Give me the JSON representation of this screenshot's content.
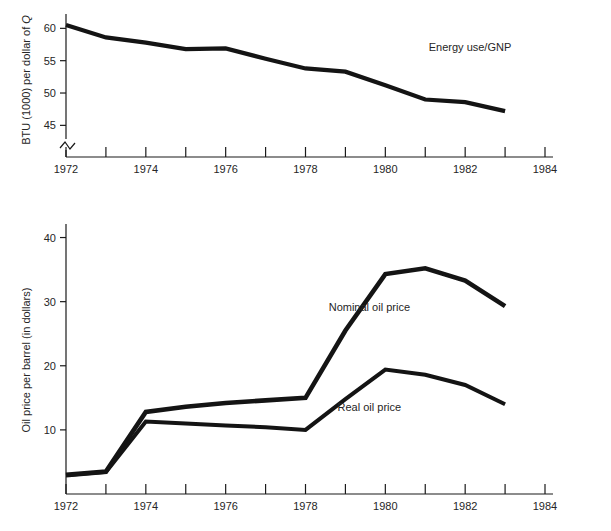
{
  "chart_data": [
    {
      "type": "line",
      "id": "energy-use-gnp",
      "title": "",
      "xlabel": "",
      "ylabel": "BTU (1000) per dollar of Q",
      "ylabel_parts": [
        "BTU (1000) per dollar of ",
        "Q"
      ],
      "annotation": "Energy use/GNP",
      "x": [
        1972,
        1973,
        1974,
        1975,
        1976,
        1977,
        1978,
        1979,
        1980,
        1981,
        1982,
        1983
      ],
      "series": [
        {
          "name": "Energy use/GNP",
          "values": [
            60.5,
            58.6,
            57.8,
            56.8,
            56.9,
            55.3,
            53.8,
            53.3,
            51.2,
            49.0,
            48.6,
            47.2
          ],
          "color": "#141414",
          "width": 4.2
        }
      ],
      "xlim": [
        1972,
        1984
      ],
      "ylim": [
        43.2,
        61.6
      ],
      "xticks": [
        1972,
        1973,
        1974,
        1975,
        1976,
        1977,
        1978,
        1979,
        1980,
        1981,
        1982,
        1983,
        1984
      ],
      "xticklabels": [
        "1972",
        "",
        "1974",
        "",
        "1976",
        "",
        "1978",
        "",
        "1980",
        "",
        "1982",
        "",
        "1984"
      ],
      "yticks": [
        45,
        50,
        55,
        60
      ],
      "yticklabels": [
        "45",
        "50",
        "55",
        "60"
      ],
      "axis_break": true,
      "grid": false,
      "legend": "inline-annotation"
    },
    {
      "type": "line",
      "id": "oil-price",
      "title": "",
      "xlabel": "",
      "ylabel": "Oil price per barrel (in dollars)",
      "x": [
        1972,
        1973,
        1974,
        1975,
        1976,
        1977,
        1978,
        1979,
        1980,
        1981,
        1982,
        1983
      ],
      "series": [
        {
          "name": "Nominal oil price",
          "values": [
            3.0,
            3.5,
            12.8,
            13.6,
            14.2,
            14.6,
            15.0,
            25.5,
            34.3,
            35.2,
            33.3,
            29.3
          ],
          "color": "#141414",
          "width": 4.6
        },
        {
          "name": "Real oil price",
          "values": [
            2.9,
            3.4,
            11.3,
            11.0,
            10.7,
            10.4,
            10.0,
            14.8,
            19.4,
            18.6,
            17.0,
            14.0
          ],
          "color": "#3b3b3b",
          "width": 4.0
        }
      ],
      "xlim": [
        1972,
        1984
      ],
      "ylim": [
        0,
        41.8
      ],
      "xticks": [
        1972,
        1973,
        1974,
        1975,
        1976,
        1977,
        1978,
        1979,
        1980,
        1981,
        1982,
        1983,
        1984
      ],
      "xticklabels": [
        "1972",
        "",
        "1974",
        "",
        "1976",
        "",
        "1978",
        "",
        "1980",
        "",
        "1982",
        "",
        "1984"
      ],
      "yticks": [
        10,
        20,
        30,
        40
      ],
      "yticklabels": [
        "10",
        "20",
        "30",
        "40"
      ],
      "axis_break": false,
      "grid": false,
      "legend": "inline-annotation",
      "annotations": [
        {
          "text": "Nominal oil price",
          "x": 1979.6,
          "y": 28.6
        },
        {
          "text": "Real oil price",
          "x": 1979.6,
          "y": 13.0
        }
      ]
    }
  ],
  "colors": {
    "ink": "#141414",
    "axis": "#1a1a1a",
    "secondary_series": "#3b3b3b",
    "background": "#ffffff"
  }
}
